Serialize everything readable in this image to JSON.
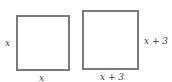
{
  "diagram": {
    "squares": [
      {
        "name": "small-square",
        "side_label": "x",
        "bottom_label": "x"
      },
      {
        "name": "large-square",
        "side_label": "x + 3",
        "bottom_label": "x + 3"
      }
    ]
  },
  "colors": {
    "stroke": "#7a7a7a",
    "text": "#3a3a3a"
  }
}
